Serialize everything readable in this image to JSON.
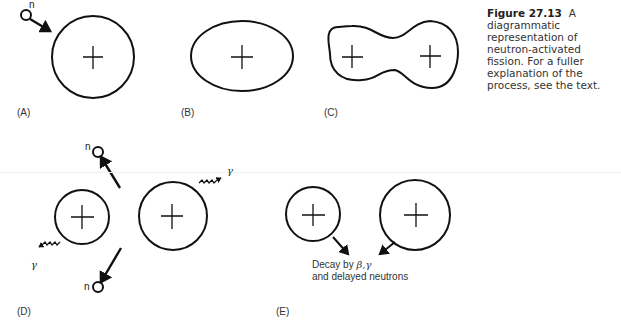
{
  "caption": {
    "figure_number": "Figure 27.13",
    "text": "A diagrammatic representation of neutron-activated fission. For a fuller explanation of the process, see the text."
  },
  "panels": [
    {
      "label": "(A)",
      "description": "neutron approaching nucleus"
    },
    {
      "label": "(B)",
      "description": "deformed ellipsoidal nucleus"
    },
    {
      "label": "(C)",
      "description": "dumbbell-shaped nucleus with two centers"
    },
    {
      "label": "(D)",
      "description": "two fragments emitting neutrons and gamma rays"
    },
    {
      "label": "(E)",
      "description": "fragments decaying"
    }
  ],
  "symbols": {
    "neutron": "n",
    "gamma": "γ",
    "plus": "+"
  },
  "annotations": {
    "decay_line1_prefix": "Decay by ",
    "decay_line1_symbols": "β,γ",
    "decay_line2": "and delayed neutrons"
  }
}
